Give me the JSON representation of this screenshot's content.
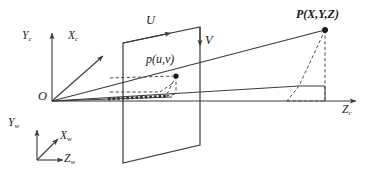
{
  "figure": {
    "stroke_color": "#3a3a3a",
    "dash_color": "#4a4a4a",
    "background": "#ffffff"
  },
  "labels": {
    "camera_y_axis": "Y",
    "camera_y_axis_sub": "c",
    "camera_x_axis": "X",
    "camera_x_axis_sub": "c",
    "camera_z_axis": "Z",
    "camera_z_axis_sub": "c",
    "world_y_axis": "Y",
    "world_y_axis_sub": "w",
    "world_x_axis": "X",
    "world_x_axis_sub": "w",
    "world_z_axis": "Z",
    "world_z_axis_sub": "w",
    "origin": "O",
    "image_u_axis": "U",
    "image_v_axis": "V",
    "image_point": "p(u,v)",
    "world_point": "P(X,Y,Z)"
  },
  "geometry": {
    "origin_px": [
      52,
      101
    ],
    "image_point_px": [
      176,
      76
    ],
    "world_point_px": [
      325,
      30
    ],
    "zc_axis_end_px": [
      356,
      101
    ],
    "image_plane_corners_px": [
      [
        123,
        43
      ],
      [
        200,
        27
      ],
      [
        200,
        145
      ],
      [
        123,
        163
      ]
    ]
  }
}
